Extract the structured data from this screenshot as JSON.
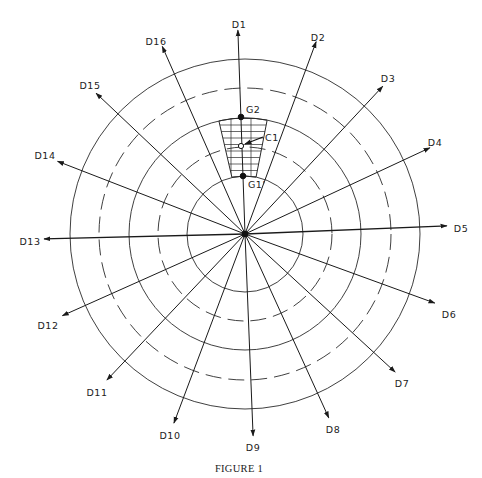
{
  "figure": {
    "caption": "FIGURE 1",
    "center": [
      245,
      234
    ],
    "colors": {
      "line": "#2a2a2a",
      "background": "#ffffff"
    }
  },
  "circles": [
    {
      "r": 58,
      "style": "solid"
    },
    {
      "r": 87,
      "style": "dashed"
    },
    {
      "r": 116,
      "style": "solid"
    },
    {
      "r": 146,
      "style": "dashed"
    },
    {
      "r": 175,
      "style": "solid"
    }
  ],
  "directions": [
    {
      "label": "D1",
      "angle": -2,
      "length": 204,
      "lx": 239,
      "ly": 25
    },
    {
      "label": "D2",
      "angle": 20.3,
      "length": 205,
      "lx": 318,
      "ly": 38
    },
    {
      "label": "D3",
      "angle": 43,
      "length": 202,
      "lx": 388,
      "ly": 79
    },
    {
      "label": "D4",
      "angle": 65,
      "length": 204,
      "lx": 435,
      "ly": 143
    },
    {
      "label": "D5",
      "angle": 87.7,
      "length": 202,
      "lx": 461,
      "ly": 229
    },
    {
      "label": "D6",
      "angle": 110,
      "length": 202,
      "lx": 449,
      "ly": 315
    },
    {
      "label": "D7",
      "angle": 132.6,
      "length": 204,
      "lx": 402,
      "ly": 384
    },
    {
      "label": "D8",
      "angle": 155.5,
      "length": 202,
      "lx": 333,
      "ly": 430
    },
    {
      "label": "D9",
      "angle": 177.7,
      "length": 202,
      "lx": 253,
      "ly": 448
    },
    {
      "label": "D10",
      "angle": 200.6,
      "length": 202,
      "lx": 170,
      "ly": 436
    },
    {
      "label": "D11",
      "angle": 223.4,
      "length": 201,
      "lx": 97,
      "ly": 393
    },
    {
      "label": "D12",
      "angle": 245.9,
      "length": 200,
      "lx": 48,
      "ly": 326
    },
    {
      "label": "D13",
      "angle": 268.6,
      "length": 201,
      "lx": 30,
      "ly": 242
    },
    {
      "label": "D14",
      "angle": 291.2,
      "length": 201,
      "lx": 45,
      "ly": 156
    },
    {
      "label": "D15",
      "angle": 313.4,
      "length": 205,
      "lx": 90,
      "ly": 86
    },
    {
      "label": "D16",
      "angle": 336.2,
      "length": 205,
      "lx": 156,
      "ly": 42
    }
  ],
  "region": {
    "inner_r": 58,
    "outer_r": 116,
    "start_angle": -13,
    "end_angle": 11,
    "hatch": "grid"
  },
  "points": [
    {
      "id": "G2",
      "label": "G2",
      "x": 241,
      "y": 117,
      "filled": true,
      "lx": 246,
      "ly": 110
    },
    {
      "id": "C1",
      "label": "C1",
      "x": 241,
      "y": 146,
      "filled": false,
      "lx": 265,
      "ly": 138
    },
    {
      "id": "G1",
      "label": "G1'",
      "x": 243,
      "y": 176,
      "filled": true,
      "lx": 248,
      "ly": 185
    }
  ]
}
